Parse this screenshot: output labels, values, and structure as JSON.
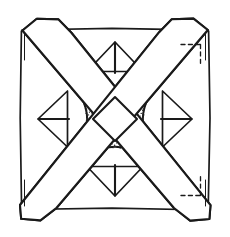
{
  "figure": {
    "width": 230,
    "height": 237,
    "background_color": "#ffffff",
    "ink_color": "#1a1a1a",
    "stipple_color": "#262626"
  },
  "geometry": {
    "frame": {
      "left": 21,
      "top": 29,
      "right": 209,
      "bottom": 209,
      "center_x": 115,
      "center_y": 119
    },
    "band": {
      "half_width": 13,
      "corner_cut": 11
    },
    "center_diamond": {
      "center_x": 115,
      "center_y": 119,
      "radius_x": 22,
      "radius_y": 22
    }
  },
  "elements": {
    "outer_frame": "square-frame",
    "saltire_band": "diagonal-x-band",
    "center_diamond": "central-white-diamond",
    "motif_top": "stippled-crescent-top",
    "motif_bottom": "stippled-crescent-bottom",
    "motif_left": "stippled-crescent-left",
    "motif_right": "stippled-crescent-right",
    "dashed_top_right": "construction-line-top-right",
    "dashed_bottom_right": "construction-line-bottom-right"
  },
  "motifs": {
    "top": {
      "name": "top-motif",
      "triangle": "apex-up-triangle-with-vertical-stem",
      "arc": "downward-arc",
      "shading": "stipple"
    },
    "bottom": {
      "name": "bottom-motif",
      "triangle": "apex-down-triangle-with-vertical-stem",
      "arc": "upward-arc",
      "shading": "stipple"
    },
    "left": {
      "name": "left-motif",
      "triangle": "apex-left-triangle-with-horizontal-stem",
      "arc": "rightward-arc",
      "shading": "stipple"
    },
    "right": {
      "name": "right-motif",
      "triangle": "apex-right-triangle-with-horizontal-stem",
      "arc": "leftward-arc",
      "shading": "stipple"
    }
  },
  "corners": {
    "top_left": {
      "label": "corner-top-left",
      "style": "solid-cut"
    },
    "top_right": {
      "label": "corner-top-right",
      "style": "dashed-cut"
    },
    "bottom_left": {
      "label": "corner-bottom-left",
      "style": "solid-cut"
    },
    "bottom_right": {
      "label": "corner-bottom-right",
      "style": "dashed-cut"
    }
  }
}
